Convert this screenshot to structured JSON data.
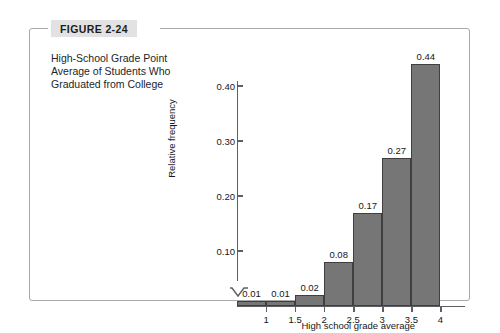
{
  "figure": {
    "tag_label": "FIGURE 2-24",
    "caption": "High-School Grade Point Average of Students Who Graduated from College"
  },
  "colors": {
    "bar_fill": "#767676",
    "bar_stroke": "#3f3f3f",
    "axis": "#5d5f63",
    "frame": "#a8a8a8",
    "tag_background": "#e2e2e2",
    "text": "#16171a"
  },
  "chart_data": {
    "type": "bar",
    "title": "",
    "xlabel": "High school grade average",
    "ylabel": "Relative frequency",
    "categories": [
      "0.5-1",
      "1-1.5",
      "1.5-2",
      "2-2.5",
      "2.5-3",
      "3-3.5",
      "3.5-4"
    ],
    "values": [
      0.01,
      0.01,
      0.02,
      0.08,
      0.17,
      0.27,
      0.44
    ],
    "value_labels": [
      "0.01",
      "0.01",
      "0.02",
      "0.08",
      "0.17",
      "0.27",
      "0.44"
    ],
    "bin_edges": [
      0.5,
      1,
      1.5,
      2,
      2.5,
      3,
      3.5,
      4
    ],
    "xticks": [
      1,
      1.5,
      2,
      2.5,
      3,
      3.5,
      4
    ],
    "xtick_labels": [
      "1",
      "1.5",
      "2",
      "2.5",
      "3",
      "3.5",
      "4"
    ],
    "yticks": [
      0.1,
      0.2,
      0.3,
      0.4
    ],
    "ytick_labels": [
      "0.10",
      "0.20",
      "0.30",
      "0.40"
    ],
    "ylim": [
      0,
      0.47
    ],
    "xlim": [
      0.5,
      4.2
    ],
    "grid": false,
    "legend": null,
    "axis_break": true
  }
}
